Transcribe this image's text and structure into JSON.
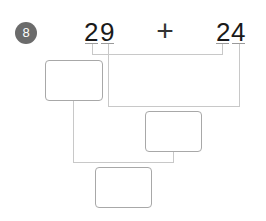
{
  "problem": {
    "number": "8",
    "left_operand": {
      "tens": "2",
      "ones": "9"
    },
    "operator": "+",
    "right_operand": {
      "tens": "2",
      "ones": "4"
    }
  },
  "answer_boxes": [
    {
      "id": "tens-sum",
      "value": ""
    },
    {
      "id": "ones-sum",
      "value": ""
    },
    {
      "id": "total",
      "value": ""
    }
  ],
  "colors": {
    "badge": "#6b6b6b",
    "connector": "#c8c8c8",
    "box_border": "#a8a8a8"
  }
}
